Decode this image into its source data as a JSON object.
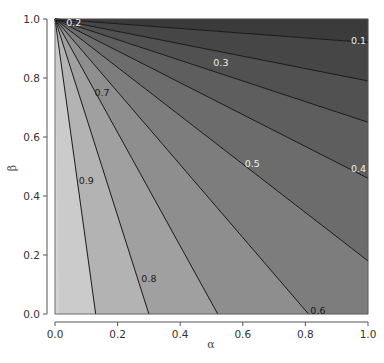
{
  "chart_data": {
    "type": "contour",
    "title": "",
    "xlabel": "α",
    "ylabel": "β",
    "xlim": [
      0.0,
      1.0
    ],
    "ylim": [
      0.0,
      1.0
    ],
    "xticks": [
      "0.0",
      "0.2",
      "0.4",
      "0.6",
      "0.8",
      "1.0"
    ],
    "yticks": [
      "0.0",
      "0.2",
      "0.4",
      "0.6",
      "0.8",
      "1.0"
    ],
    "grid": false,
    "legend": null,
    "apex": {
      "alpha": 0.0,
      "beta": 1.0
    },
    "contours": [
      {
        "level": 0.9,
        "label": "0.9",
        "end_edge": "bottom",
        "end": {
          "alpha": 0.13,
          "beta": 0.0
        },
        "label_pos": {
          "alpha": 0.1,
          "beta": 0.45
        },
        "label_color": "dark"
      },
      {
        "level": 0.8,
        "label": "0.8",
        "end_edge": "bottom",
        "end": {
          "alpha": 0.3,
          "beta": 0.0
        },
        "label_pos": {
          "alpha": 0.3,
          "beta": 0.12
        },
        "label_color": "dark"
      },
      {
        "level": 0.7,
        "label": "0.7",
        "end_edge": "bottom",
        "end": {
          "alpha": 0.52,
          "beta": 0.0
        },
        "label_pos": {
          "alpha": 0.15,
          "beta": 0.75
        },
        "label_color": "dark"
      },
      {
        "level": 0.6,
        "label": "0.6",
        "end_edge": "bottom",
        "end": {
          "alpha": 0.81,
          "beta": 0.0
        },
        "label_pos": {
          "alpha": 0.84,
          "beta": 0.01
        },
        "label_color": "dark"
      },
      {
        "level": 0.5,
        "label": "0.5",
        "end_edge": "right",
        "end": {
          "alpha": 1.0,
          "beta": 0.18
        },
        "label_pos": {
          "alpha": 0.63,
          "beta": 0.51
        },
        "label_color": "light"
      },
      {
        "level": 0.4,
        "label": "0.4",
        "end_edge": "right",
        "end": {
          "alpha": 1.0,
          "beta": 0.46
        },
        "label_pos": {
          "alpha": 0.97,
          "beta": 0.49
        },
        "label_color": "light"
      },
      {
        "level": 0.3,
        "label": "0.3",
        "end_edge": "right",
        "end": {
          "alpha": 1.0,
          "beta": 0.65
        },
        "label_pos": {
          "alpha": 0.53,
          "beta": 0.85
        },
        "label_color": "light"
      },
      {
        "level": 0.2,
        "label": "0.2",
        "end_edge": "right",
        "end": {
          "alpha": 1.0,
          "beta": 0.79
        },
        "label_pos": {
          "alpha": 0.06,
          "beta": 0.985
        },
        "label_color": "light"
      },
      {
        "level": 0.1,
        "label": "0.1",
        "end_edge": "right",
        "end": {
          "alpha": 1.0,
          "beta": 0.92
        },
        "label_pos": {
          "alpha": 0.97,
          "beta": 0.925
        },
        "label_color": "light"
      }
    ],
    "band_colors": [
      "#cbcbcb",
      "#b3b3b3",
      "#a0a0a0",
      "#8e8e8e",
      "#7d7d7d",
      "#6c6c6c",
      "#5e5e5e",
      "#515151",
      "#464646",
      "#3b3b3b"
    ]
  },
  "caption_fragment": "FIG. ..."
}
